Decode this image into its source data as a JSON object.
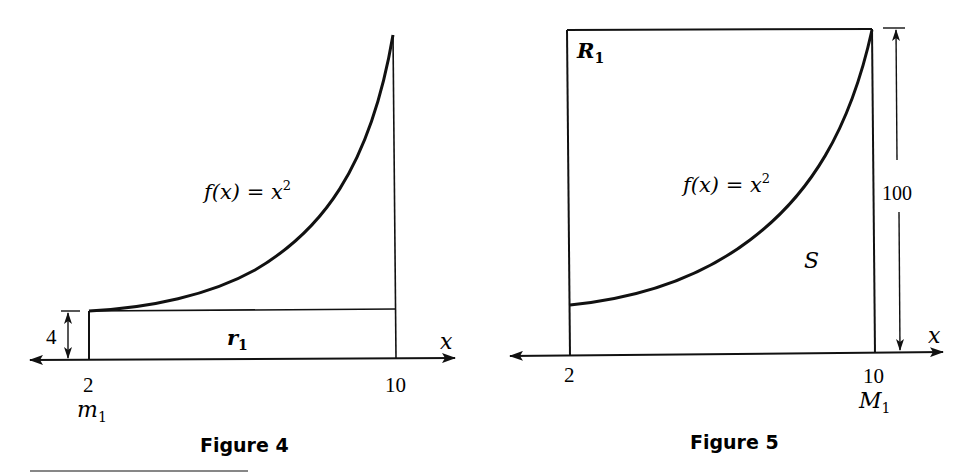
{
  "figures": [
    {
      "caption": "Figure 4",
      "function_label": "f(x) = x",
      "function_exponent": "2",
      "x_axis_label": "x",
      "tick_left": "2",
      "tick_right": "10",
      "min_label": "m",
      "min_sub": "1",
      "rect_label": "r",
      "rect_sub": "1",
      "height_label": "4"
    },
    {
      "caption": "Figure 5",
      "function_label": "f(x) = x",
      "function_exponent": "2",
      "x_axis_label": "x",
      "tick_left": "2",
      "tick_right": "10",
      "max_label": "M",
      "max_sub": "1",
      "rect_label": "R",
      "rect_sub": "1",
      "region_label": "S",
      "height_label": "100"
    }
  ],
  "colors": {
    "ink": "#111111",
    "background": "#ffffff"
  }
}
